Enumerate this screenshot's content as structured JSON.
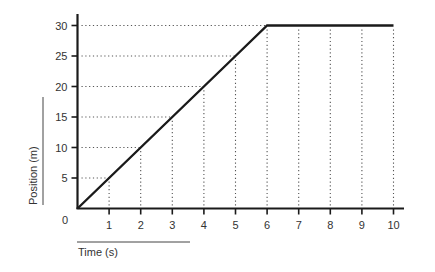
{
  "chart_data": {
    "type": "line",
    "title": "",
    "xlabel": "Time (s)",
    "ylabel": "Position (m)",
    "x": [
      0,
      1,
      2,
      3,
      4,
      5,
      6,
      7,
      8,
      9,
      10
    ],
    "series": [
      {
        "name": "Position",
        "values": [
          0,
          5,
          10,
          15,
          20,
          25,
          30,
          30,
          30,
          30,
          30
        ]
      }
    ],
    "xticks": [
      "1",
      "2",
      "3",
      "4",
      "5",
      "6",
      "7",
      "8",
      "9",
      "10"
    ],
    "yticks": [
      "5",
      "10",
      "15",
      "20",
      "25",
      "30"
    ],
    "origin_label": "0",
    "xlim": [
      0,
      10
    ],
    "ylim": [
      0,
      30
    ],
    "grid": "dotted drop-lines from data points to axes",
    "legend": null
  },
  "colors": {
    "line": "#1a1a1a",
    "axis": "#1a1a1a",
    "grid": "#555555",
    "text": "#333333"
  }
}
